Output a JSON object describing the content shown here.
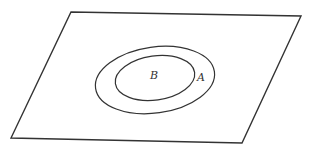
{
  "diagram": {
    "type": "venn-subset",
    "plane": {
      "points": [
        [
          71,
          12
        ],
        [
          301,
          16
        ],
        [
          242,
          143
        ],
        [
          11,
          138
        ]
      ]
    },
    "sets": [
      {
        "name": "outer-set",
        "label": "A",
        "cx": 155,
        "cy": 80,
        "rx": 60,
        "ry": 33,
        "rotate": -8,
        "label_x": 197,
        "label_y": 72
      },
      {
        "name": "inner-set",
        "label": "B",
        "cx": 155,
        "cy": 78,
        "rx": 40,
        "ry": 22,
        "rotate": -8,
        "label_x": 150,
        "label_y": 70
      }
    ],
    "stroke_color": "#333333"
  }
}
